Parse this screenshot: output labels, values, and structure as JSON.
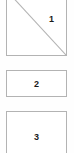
{
  "canvas": {
    "width": 74,
    "height": 153,
    "background_color": "#ffffff"
  },
  "style": {
    "border_color": "#b3b3b3",
    "diagonal_color": "#b3b3b3",
    "label_color": "#1a1a1a",
    "fill_color": "#ffffff"
  },
  "shapes": [
    {
      "id": "shape-1",
      "type": "rectangle-with-diagonal",
      "label": "1",
      "label_position": "upper-right",
      "clipped": "top",
      "diagonal": {
        "from": "top-left",
        "to": "bottom-right"
      }
    },
    {
      "id": "shape-2",
      "type": "rectangle",
      "label": "2",
      "label_position": "center",
      "clipped": "none"
    },
    {
      "id": "shape-3",
      "type": "rectangle",
      "label": "3",
      "label_position": "center",
      "clipped": "bottom"
    }
  ]
}
